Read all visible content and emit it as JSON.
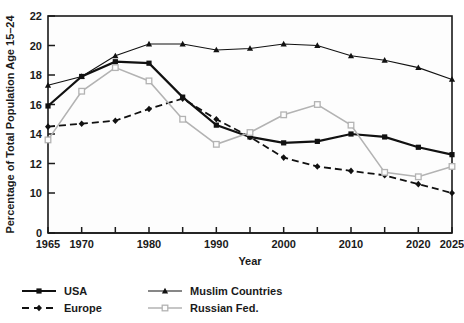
{
  "chart_data": {
    "type": "line",
    "title": "",
    "xlabel": "Year",
    "ylabel": "Percentage of Total Population Age 15–24",
    "x": [
      1965,
      1970,
      1975,
      1980,
      1985,
      1990,
      1995,
      2000,
      2005,
      2010,
      2015,
      2020,
      2025
    ],
    "xtick_labels": [
      "1965",
      "1970",
      "",
      "1980",
      "",
      "1990",
      "",
      "2000",
      "",
      "2010",
      "",
      "2020",
      "2025"
    ],
    "xlim": [
      1965,
      2025
    ],
    "ytick_labels": [
      "0",
      "10",
      "12",
      "14",
      "16",
      "18",
      "20",
      "22"
    ],
    "ytick_values": [
      0,
      10,
      12,
      14,
      16,
      18,
      20,
      22
    ],
    "ylim": [
      10,
      22
    ],
    "y_axis_break": true,
    "grid": false,
    "legend_position": "below-left",
    "series": [
      {
        "name": "USA",
        "marker": "filled-square",
        "line": "solid",
        "color": "#111111",
        "width": 2.2,
        "values": [
          15.9,
          17.9,
          18.9,
          18.8,
          16.5,
          14.6,
          13.8,
          13.4,
          13.5,
          14.0,
          13.8,
          13.1,
          12.6
        ]
      },
      {
        "name": "Europe",
        "marker": "filled-diamond",
        "line": "dashed",
        "color": "#111111",
        "width": 1.8,
        "values": [
          14.5,
          14.7,
          14.9,
          15.7,
          16.4,
          15.0,
          13.8,
          12.4,
          11.8,
          11.5,
          11.2,
          10.6,
          10.0
        ]
      },
      {
        "name": "Muslim Countries",
        "marker": "filled-triangle",
        "line": "solid",
        "color": "#111111",
        "width": 1.1,
        "values": [
          17.3,
          17.9,
          19.3,
          20.1,
          20.1,
          19.7,
          19.8,
          20.1,
          20.0,
          19.3,
          19.0,
          18.5,
          17.7
        ]
      },
      {
        "name": "Russian Fed.",
        "marker": "open-square",
        "line": "solid",
        "color": "#b3b3b3",
        "width": 1.6,
        "values": [
          13.6,
          16.9,
          18.5,
          17.6,
          15.0,
          13.3,
          14.1,
          15.3,
          16.0,
          14.6,
          11.4,
          11.1,
          11.8
        ]
      }
    ]
  },
  "legend": {
    "items": [
      {
        "label": "USA"
      },
      {
        "label": "Muslim Countries"
      },
      {
        "label": "Europe"
      },
      {
        "label": "Russian Fed."
      }
    ]
  }
}
